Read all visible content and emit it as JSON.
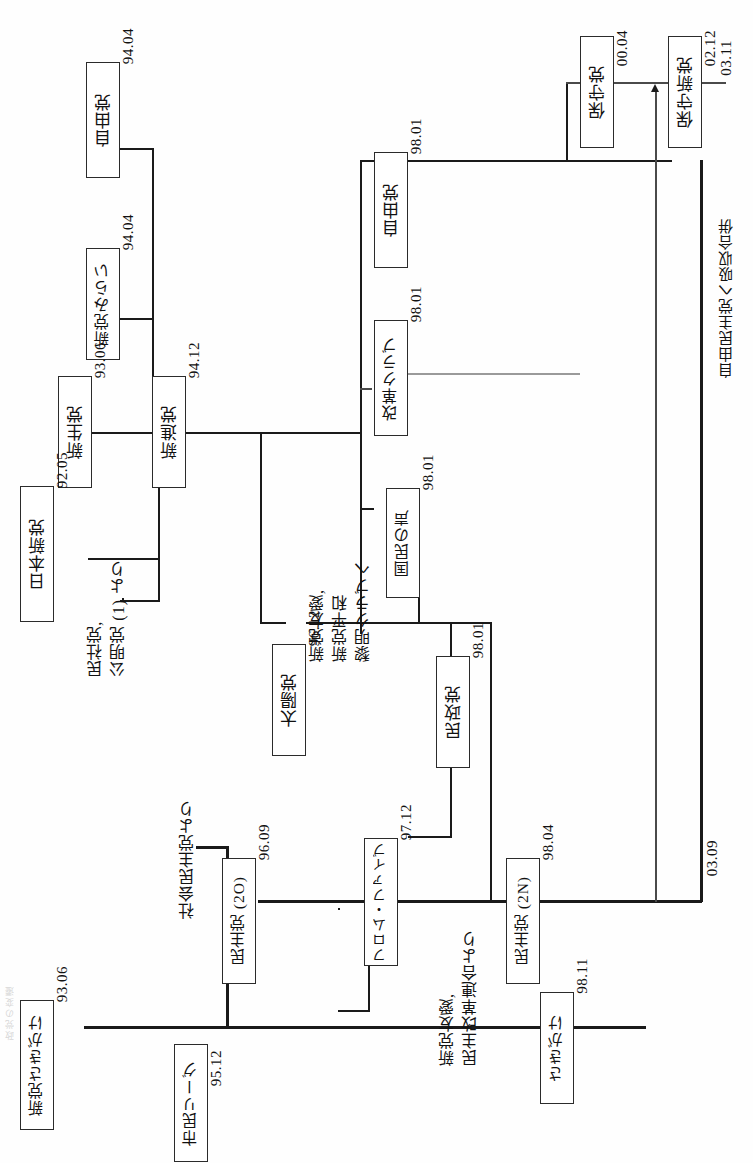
{
  "figure": {
    "type": "party-genealogy-flow-diagram",
    "orientation": "rotated-90-ccw",
    "language": "ja",
    "edge_caption": "政党の変遷"
  },
  "nodes": [
    {
      "id": "jiyuto94",
      "label": "自由党",
      "date": "94.04"
    },
    {
      "id": "shintomirai",
      "label": "新党みらい",
      "date": "94.04"
    },
    {
      "id": "shinseito",
      "label": "新生党",
      "date": "93.06"
    },
    {
      "id": "shinshinto",
      "label": "新進党",
      "date": "94.12"
    },
    {
      "id": "nihonshinto",
      "label": "日本新党",
      "date": "92.05"
    },
    {
      "id": "taiyoto",
      "label": "太陽党",
      "date": "96.12"
    },
    {
      "id": "fromfive",
      "label": "フロム・ファイブ",
      "date": "97.12"
    },
    {
      "id": "jiyuto98",
      "label": "自由党",
      "date": "98.01"
    },
    {
      "id": "kakakuclub",
      "label": "改革クラブ",
      "date": "98.01"
    },
    {
      "id": "kokuminkoe",
      "label": "国民の声",
      "date": "98.01"
    },
    {
      "id": "minseito",
      "label": "民政党",
      "date": "98.01"
    },
    {
      "id": "hoshuto",
      "label": "保守党",
      "date": "00.04"
    },
    {
      "id": "hoshushinto",
      "label": "保守新党",
      "date": "02.12"
    },
    {
      "id": "minshuto2o",
      "label": "民主党 (2O)",
      "date": "96.09"
    },
    {
      "id": "minshuto2n",
      "label": "民主党 (2N)",
      "date": "98.04"
    },
    {
      "id": "shintosakigake",
      "label": "新党さきがけ",
      "date": "93.06"
    },
    {
      "id": "shiminleague",
      "label": "市民リーグ",
      "date": "95.12"
    },
    {
      "id": "sakigake",
      "label": "さきがけ",
      "date": "98.11"
    }
  ],
  "annotations": [
    {
      "id": "minsha-komei",
      "text": "民社党,\n公明党 (1) より"
    },
    {
      "id": "shinto-yuai-heiwa",
      "text": "新党友愛,\n新党平和\n黎明クラブへ"
    },
    {
      "id": "shakaiminshu",
      "text": "社会民主党より"
    },
    {
      "id": "yuai-minshukaikaku",
      "text": "新党友愛,\n民主改革連合より"
    },
    {
      "id": "kyushu-gappei",
      "text": "自由民主党へ吸収合併"
    }
  ],
  "loose_dates": [
    {
      "id": "date-0311",
      "value": "03.11"
    },
    {
      "id": "date-0309",
      "value": "03.09"
    }
  ],
  "colors": {
    "ink": "#1a1a1a",
    "box_border": "#2b2b2b",
    "grey_line": "#9a9a9a",
    "paper": "#fefefe"
  }
}
